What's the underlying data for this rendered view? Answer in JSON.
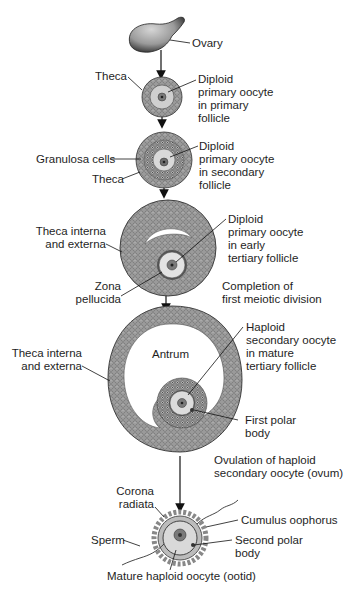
{
  "figure": {
    "colors": {
      "tissue_dark": "#5a5a5a",
      "tissue_mid": "#8c8c8c",
      "tissue_light": "#b4b4b4",
      "oocyte_fill": "#d8d8d8",
      "nucleus_fill": "#6e6e6e",
      "line": "#1a1a1a",
      "background": "#ffffff"
    },
    "stages": [
      {
        "id": "ovary",
        "label": "Ovary"
      },
      {
        "id": "primary-follicle",
        "structure_labels": [
          "Theca"
        ],
        "description": [
          "Diploid",
          "primary oocyte",
          "in primary",
          "follicle"
        ]
      },
      {
        "id": "secondary-follicle",
        "structure_labels": [
          "Granulosa cells",
          "Theca"
        ],
        "description": [
          "Diploid",
          "primary oocyte",
          "in secondary",
          "follicle"
        ]
      },
      {
        "id": "early-tertiary-follicle",
        "structure_labels": [
          [
            "Theca interna",
            "and externa"
          ],
          [
            "Zona",
            "pellucida"
          ]
        ],
        "description": [
          "Diploid",
          "primary oocyte",
          "in early",
          "tertiary follicle"
        ]
      },
      {
        "id": "transition-1",
        "description": [
          "Completion of",
          "first meiotic division"
        ]
      },
      {
        "id": "mature-tertiary-follicle",
        "structure_labels": [
          [
            "Theca interna",
            "and externa"
          ],
          "Antrum",
          [
            "First polar",
            "body"
          ]
        ],
        "description": [
          "Haploid",
          "secondary oocyte",
          "in mature",
          "tertiary follicle"
        ]
      },
      {
        "id": "transition-2",
        "description": [
          "Ovulation of haploid",
          "secondary oocyte (ovum)"
        ]
      },
      {
        "id": "ootid",
        "structure_labels": [
          [
            "Corona",
            "radiata"
          ],
          "Sperm",
          "Cumulus oophorus",
          [
            "Second polar",
            "body"
          ]
        ],
        "description": [
          "Mature haploid oocyte (ootid)"
        ]
      }
    ]
  },
  "labels": {
    "ovary": "Ovary",
    "theca_1": "Theca",
    "primary": [
      "Diploid",
      "primary oocyte",
      "in primary",
      "follicle"
    ],
    "granulosa": "Granulosa cells",
    "theca_2": "Theca",
    "secondary": [
      "Diploid",
      "primary oocyte",
      "in secondary",
      "follicle"
    ],
    "theca_ie_1": [
      "Theca interna",
      "and externa"
    ],
    "early_tertiary": [
      "Diploid",
      "primary oocyte",
      "in early",
      "tertiary follicle"
    ],
    "zona": [
      "Zona",
      "pellucida"
    ],
    "meiosis1": [
      "Completion of",
      "first meiotic division"
    ],
    "theca_ie_2": [
      "Theca interna",
      "and externa"
    ],
    "antrum": "Antrum",
    "mature_tertiary": [
      "Haploid",
      "secondary oocyte",
      "in mature",
      "tertiary follicle"
    ],
    "first_polar": [
      "First polar",
      "body"
    ],
    "ovulation": [
      "Ovulation of haploid",
      "secondary oocyte (ovum)"
    ],
    "corona": [
      "Corona",
      "radiata"
    ],
    "cumulus": "Cumulus oophorus",
    "sperm": "Sperm",
    "second_polar": [
      "Second polar",
      "body"
    ],
    "ootid": "Mature haploid oocyte (ootid)"
  }
}
